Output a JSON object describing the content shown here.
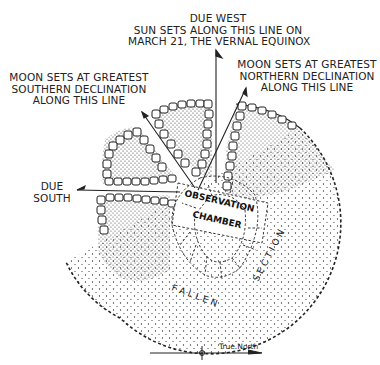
{
  "labels": {
    "due_west": [
      "DUE WEST",
      "SUN SETS ALONG THIS LINE ON",
      "MARCH 21, THE VERNAL EQUINOX"
    ],
    "moon_south": [
      "MOON SETS AT GREATEST",
      "SOUTHERN DECLINATION",
      "ALONG THIS LINE"
    ],
    "moon_north": [
      "MOON SETS AT GREATEST",
      "NORTHERN DECLINATION",
      "ALONG THIS LINE"
    ],
    "due_south": [
      "DUE",
      "SOUTH"
    ],
    "chamber": [
      "OBSERVATION",
      "CHAMBER"
    ],
    "fallen": "F A L L E N",
    "section": "S E C T I O N",
    "compass": "True North"
  },
  "colors": {
    "ink": "#1a1a1a",
    "background": "#ffffff"
  }
}
